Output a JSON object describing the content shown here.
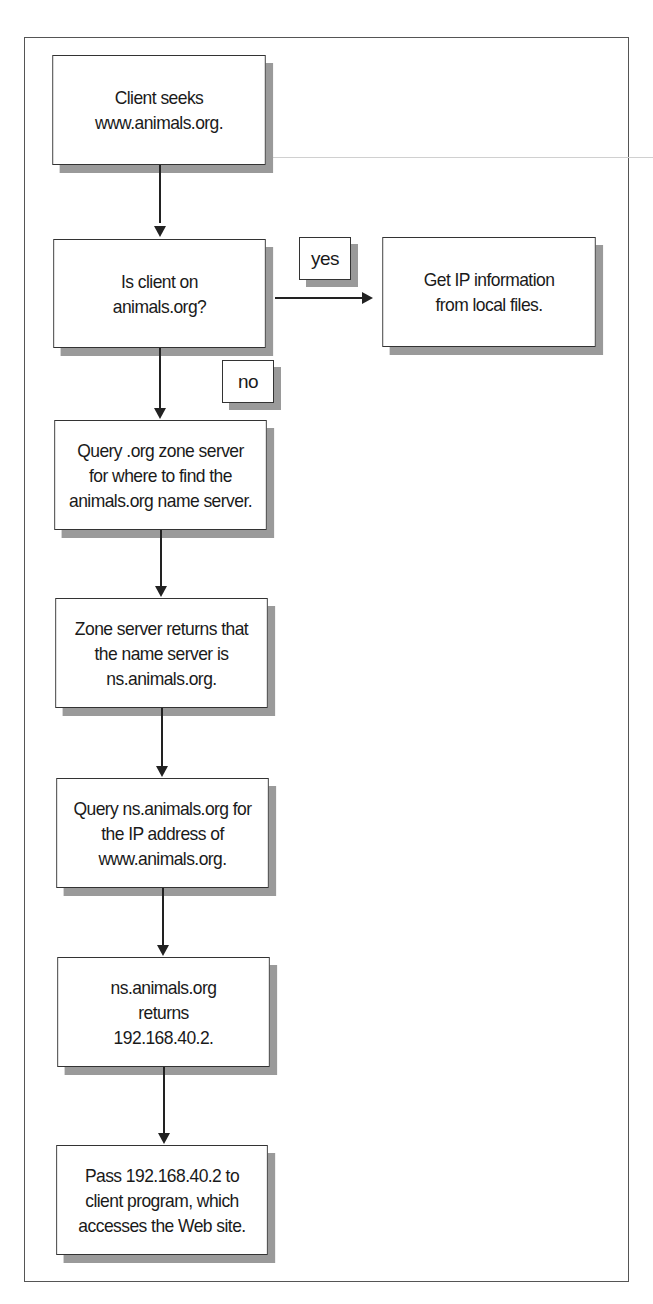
{
  "diagram": {
    "type": "flowchart",
    "nodes": [
      {
        "id": "client_seeks",
        "text": "Client seeks\nwww.animals.org."
      },
      {
        "id": "is_client_on",
        "text": "Is client on\nanimals.org?"
      },
      {
        "id": "get_ip_local",
        "text": "Get IP information\nfrom local files."
      },
      {
        "id": "query_org_zone",
        "text": "Query .org zone server\nfor where to find the\nanimals.org name server."
      },
      {
        "id": "zone_returns",
        "text": "Zone server returns that\nthe name server is\nns.animals.org."
      },
      {
        "id": "query_ns",
        "text": "Query ns.animals.org for\nthe IP address of\nwww.animals.org."
      },
      {
        "id": "ns_returns",
        "text": "ns.animals.org\nreturns\n192.168.40.2."
      },
      {
        "id": "pass_to_client",
        "text": "Pass 192.168.40.2 to\nclient program, which\naccesses the Web site."
      }
    ],
    "edge_labels": {
      "yes": "yes",
      "no": "no"
    },
    "edges": [
      {
        "from": "client_seeks",
        "to": "is_client_on"
      },
      {
        "from": "is_client_on",
        "to": "get_ip_local",
        "label": "yes"
      },
      {
        "from": "is_client_on",
        "to": "query_org_zone",
        "label": "no"
      },
      {
        "from": "query_org_zone",
        "to": "zone_returns"
      },
      {
        "from": "zone_returns",
        "to": "query_ns"
      },
      {
        "from": "query_ns",
        "to": "ns_returns"
      },
      {
        "from": "ns_returns",
        "to": "pass_to_client"
      }
    ]
  }
}
